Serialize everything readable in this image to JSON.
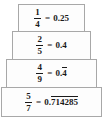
{
  "diagram": {
    "type": "stacked-equation-boxes",
    "rows": [
      {
        "numerator": "1",
        "denominator": "4",
        "equals": "=",
        "decimal_prefix": "0.25",
        "decimal_repeating": "",
        "decimal_full": "0.25",
        "repeating": false
      },
      {
        "numerator": "2",
        "denominator": "5",
        "equals": "=",
        "decimal_prefix": "0.4",
        "decimal_repeating": "",
        "decimal_full": "0.4",
        "repeating": false
      },
      {
        "numerator": "4",
        "denominator": "9",
        "equals": "=",
        "decimal_prefix": "0.",
        "decimal_repeating": "4",
        "decimal_full": "0.4 repeating",
        "repeating": true
      },
      {
        "numerator": "5",
        "denominator": "7",
        "equals": "=",
        "decimal_prefix": "0.",
        "decimal_repeating": "714285",
        "decimal_full": "0.714285 repeating",
        "repeating": true
      }
    ]
  },
  "colors": {
    "background": "#ffffff",
    "box_fill": "#fdfdfd",
    "box_border": "#a8a8a8",
    "text": "#1a1a1a"
  }
}
